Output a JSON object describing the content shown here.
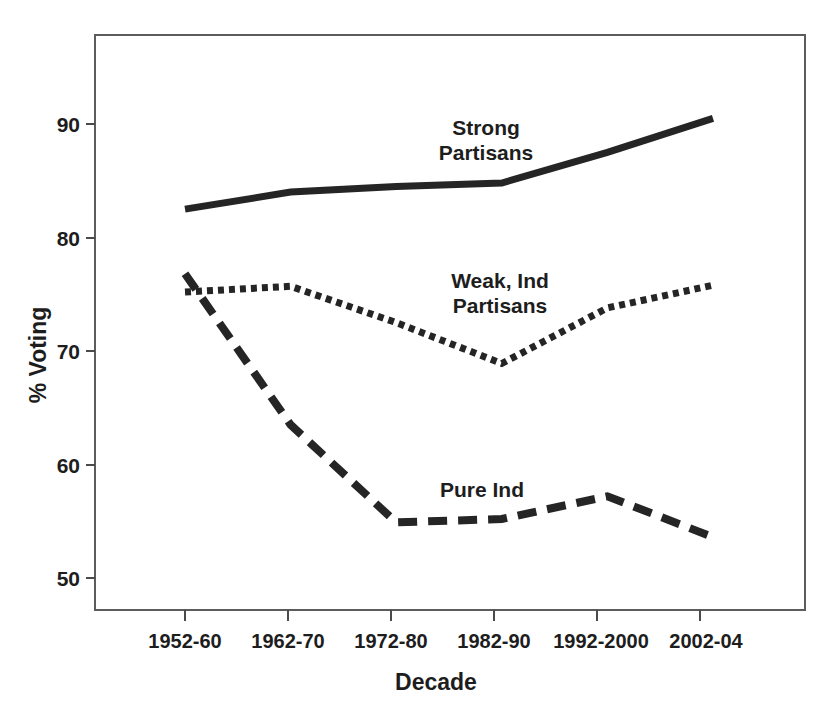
{
  "chart_data": {
    "type": "line",
    "title": "",
    "xlabel": "Decade",
    "ylabel": "% Voting",
    "categories": [
      "1952-60",
      "1962-70",
      "1972-80",
      "1982-90",
      "1992-2000",
      "2002-04"
    ],
    "ylim": [
      47,
      95
    ],
    "yticks": [
      50,
      60,
      70,
      80,
      90
    ],
    "ytick_labels": [
      "50",
      "60",
      "70",
      "80",
      "90"
    ],
    "grid": false,
    "legend_position": "inline-annotations",
    "series": [
      {
        "name": "Strong Partisans",
        "style": "solid",
        "color": "#252525",
        "values": [
          82.5,
          84.0,
          84.5,
          84.8,
          87.5,
          90.5
        ],
        "label_lines": [
          "Strong",
          "Partisans"
        ]
      },
      {
        "name": "Weak, Ind Partisans",
        "style": "dotted",
        "color": "#252525",
        "values": [
          75.2,
          75.7,
          72.5,
          68.9,
          73.8,
          75.8
        ],
        "label_lines": [
          "Weak, Ind",
          "Partisans"
        ]
      },
      {
        "name": "Pure Ind",
        "style": "dashed",
        "color": "#252525",
        "values": [
          76.8,
          63.5,
          54.9,
          55.2,
          57.2,
          53.6
        ],
        "label_lines": [
          "Pure Ind"
        ]
      }
    ]
  },
  "axis": {
    "y_title": "% Voting",
    "x_title": "Decade",
    "y_ticks": [
      "50",
      "60",
      "70",
      "80",
      "90"
    ],
    "x_ticks": [
      "1952-60",
      "1962-70",
      "1972-80",
      "1982-90",
      "1992-2000",
      "2002-04"
    ]
  },
  "annotations": {
    "strong_line1": "Strong",
    "strong_line2": "Partisans",
    "weak_line1": "Weak, Ind",
    "weak_line2": "Partisans",
    "pure_line1": "Pure Ind"
  }
}
